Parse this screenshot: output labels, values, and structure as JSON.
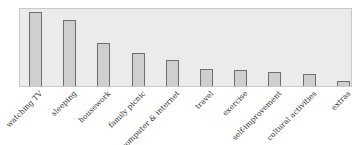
{
  "chart_data": {
    "type": "bar",
    "title": "",
    "xlabel": "",
    "ylabel": "",
    "categories": [
      "watching TV",
      "sleeping",
      "housework",
      "family picnic",
      "computer & internet",
      "travel",
      "exercise",
      "self-improvement",
      "cultural activities",
      "extras"
    ],
    "values": [
      74,
      66,
      43,
      33,
      26,
      17,
      16,
      14,
      12,
      5
    ],
    "ylim": [
      0,
      79
    ],
    "grid": false,
    "legend": null,
    "colors": {
      "bar_fill": "#cfcfcf",
      "bar_edge": "#6e6e6e",
      "plot_bg": "#ebebeb"
    }
  }
}
